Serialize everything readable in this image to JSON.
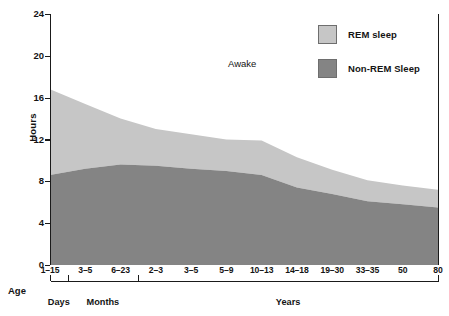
{
  "chart_data": {
    "type": "area",
    "stacked": true,
    "title": "",
    "xlabel": "Age",
    "ylabel": "Hours",
    "ylim": [
      0,
      24
    ],
    "yticks": [
      0,
      4,
      8,
      12,
      16,
      20,
      24
    ],
    "grid": false,
    "legend_position": "top-right",
    "annotations": [
      {
        "text": "Awake",
        "x_frac": 0.47,
        "y_hours": 19.3
      }
    ],
    "categories": [
      "1–15",
      "3–5",
      "6–23",
      "2–3",
      "3–5",
      "5–9",
      "10–13",
      "14–18",
      "19–30",
      "33–35",
      "50",
      "80"
    ],
    "group_brackets": [
      {
        "label": "Days",
        "from": 0,
        "to": 0
      },
      {
        "label": "Months",
        "from": 1,
        "to": 2
      },
      {
        "label": "Years",
        "from": 3,
        "to": 11
      }
    ],
    "series": [
      {
        "name": "Non-REM Sleep",
        "color": "#848484",
        "values": [
          8.6,
          9.2,
          9.6,
          9.5,
          9.2,
          9.0,
          8.6,
          7.4,
          6.8,
          6.1,
          5.8,
          5.5
        ]
      },
      {
        "name": "REM sleep",
        "color": "#c6c6c6",
        "values": [
          8.2,
          6.2,
          4.4,
          3.5,
          3.3,
          3.0,
          3.3,
          2.9,
          2.3,
          2.0,
          1.8,
          1.7
        ]
      }
    ],
    "total_sleep": [
      16.8,
      15.4,
      14.0,
      13.0,
      12.5,
      12.0,
      11.9,
      10.3,
      9.1,
      8.1,
      7.6,
      7.2
    ]
  },
  "legend": {
    "items": [
      {
        "label": "REM sleep",
        "color": "#c6c6c6"
      },
      {
        "label": "Non-REM Sleep",
        "color": "#848484"
      }
    ]
  },
  "axes": {
    "y_title": "Hours",
    "y_ticklabels": [
      "24",
      "20",
      "16",
      "12",
      "8",
      "4",
      "0"
    ],
    "x_title": "Age",
    "x_ticklabels": [
      "1–15",
      "3–5",
      "6–23",
      "2–3",
      "3–5",
      "5–9",
      "10–13",
      "14–18",
      "19–30",
      "33–35",
      "50",
      "80"
    ],
    "group_labels": [
      "Days",
      "Months",
      "Years"
    ]
  },
  "annotation": {
    "awake": "Awake"
  },
  "colors": {
    "rem": "#c6c6c6",
    "non_rem": "#848484",
    "axis": "#1a1a1a",
    "background": "#ffffff"
  }
}
